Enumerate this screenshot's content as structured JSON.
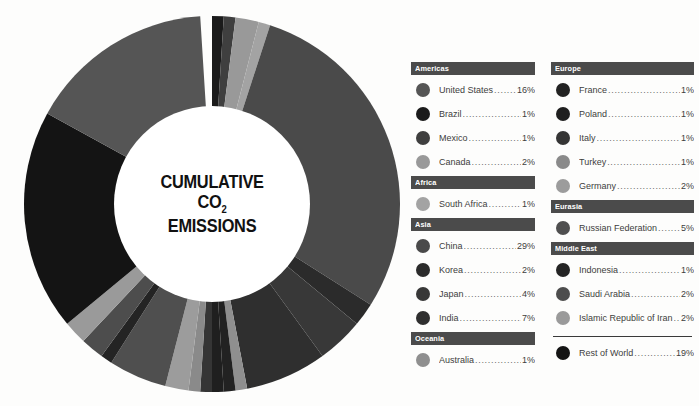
{
  "center": {
    "line1": "CUMULATIVE",
    "line2_main": "CO",
    "line2_sub": "2",
    "line3": "EMISSIONS"
  },
  "colors": {
    "background": "#fdfdfc",
    "header_bar": "#4b4b4b",
    "header_text": "#ffffff",
    "legend_text": "#3d3d3d",
    "donut_hole": "#ffffff",
    "divider": "#3a3a3a"
  },
  "legend": {
    "left_column": [
      {
        "group": "Americas",
        "items": [
          {
            "name": "United States",
            "value": "16%",
            "color": "#555555"
          },
          {
            "name": "Brazil",
            "value": "1%",
            "color": "#1b1b1b"
          },
          {
            "name": "Mexico",
            "value": "1%",
            "color": "#3f3f3f"
          },
          {
            "name": "Canada",
            "value": "2%",
            "color": "#999999"
          }
        ]
      },
      {
        "group": "Africa",
        "items": [
          {
            "name": "South Africa",
            "value": "1%",
            "color": "#a3a3a3"
          }
        ]
      },
      {
        "group": "Asia",
        "items": [
          {
            "name": "China",
            "value": "29%",
            "color": "#4a4a4a"
          },
          {
            "name": "Korea",
            "value": "2%",
            "color": "#2b2b2b"
          },
          {
            "name": "Japan",
            "value": "4%",
            "color": "#383838"
          },
          {
            "name": "India",
            "value": "7%",
            "color": "#2f2f2f"
          }
        ]
      },
      {
        "group": "Oceania",
        "items": [
          {
            "name": "Australia",
            "value": "1%",
            "color": "#8f8f8f"
          }
        ]
      }
    ],
    "right_column": [
      {
        "group": "Europe",
        "items": [
          {
            "name": "France",
            "value": "1%",
            "color": "#222222"
          },
          {
            "name": "Poland",
            "value": "1%",
            "color": "#1f1f1f"
          },
          {
            "name": "Italy",
            "value": "1%",
            "color": "#353535"
          },
          {
            "name": "Turkey",
            "value": "1%",
            "color": "#8a8a8a"
          },
          {
            "name": "Germany",
            "value": "2%",
            "color": "#9c9c9c"
          }
        ]
      },
      {
        "group": "Eurasia",
        "items": [
          {
            "name": "Russian Federation",
            "value": "5%",
            "color": "#4f4f4f"
          }
        ]
      },
      {
        "group": "Middle East",
        "items": [
          {
            "name": "Indonesia",
            "value": "1%",
            "color": "#242424"
          },
          {
            "name": "Saudi Arabia",
            "value": "2%",
            "color": "#4d4d4d"
          },
          {
            "name": "Islamic Republic of Iran",
            "value": "2%",
            "color": "#9a9a9a"
          }
        ]
      }
    ],
    "footer_item": {
      "name": "Rest of World",
      "value": "19%",
      "color": "#141414"
    },
    "dots": "......................................"
  },
  "chart_data": {
    "type": "pie",
    "title": "CUMULATIVE CO2 EMISSIONS",
    "donut": true,
    "inner_radius_ratio": 0.52,
    "start_angle_deg": -90,
    "units": "percent of cumulative CO2 emissions",
    "categories": [
      "United States",
      "Brazil",
      "Mexico",
      "Canada",
      "South Africa",
      "China",
      "Korea",
      "Japan",
      "India",
      "Australia",
      "France",
      "Poland",
      "Italy",
      "Turkey",
      "Germany",
      "Russian Federation",
      "Indonesia",
      "Saudi Arabia",
      "Islamic Republic of Iran",
      "Rest of World"
    ],
    "values": [
      16,
      1,
      1,
      2,
      1,
      29,
      2,
      4,
      7,
      1,
      1,
      1,
      1,
      1,
      2,
      5,
      1,
      2,
      2,
      19
    ],
    "colors": [
      "#555555",
      "#1b1b1b",
      "#3f3f3f",
      "#999999",
      "#a3a3a3",
      "#4a4a4a",
      "#2b2b2b",
      "#383838",
      "#2f2f2f",
      "#8f8f8f",
      "#222222",
      "#1f1f1f",
      "#353535",
      "#8a8a8a",
      "#9c9c9c",
      "#4f4f4f",
      "#242424",
      "#4d4d4d",
      "#9a9a9a",
      "#141414"
    ],
    "slice_order_clockwise_from_top": [
      "Brazil",
      "Mexico",
      "Canada",
      "South Africa",
      "China",
      "Korea",
      "Japan",
      "India",
      "Australia",
      "France",
      "Poland",
      "Italy",
      "Turkey",
      "Germany",
      "Russian Federation",
      "Indonesia",
      "Saudi Arabia",
      "Islamic Republic of Iran",
      "Rest of World",
      "United States"
    ],
    "legend_position": "right",
    "grid": false,
    "total": 100
  }
}
